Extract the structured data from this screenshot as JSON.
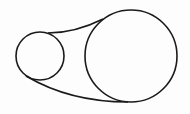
{
  "diagram": {
    "type": "belt-and-pulley",
    "background_color": "#fdfdfd",
    "stroke_color": "#1a1a1a",
    "stroke_width": 1.6,
    "small_pulley": {
      "cx": 40,
      "cy": 56,
      "r": 24
    },
    "large_pulley": {
      "cx": 131,
      "cy": 56,
      "r": 46
    },
    "belt": {
      "upper_segment": "M 48 33 Q 75 33 103 19",
      "lower_segment": "M 26 76 Q 70 102 128 102"
    }
  }
}
